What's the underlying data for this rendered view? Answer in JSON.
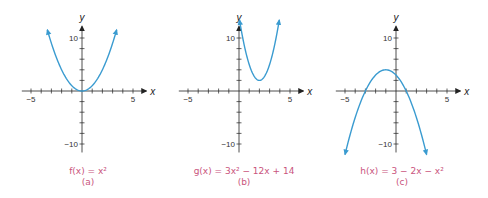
{
  "figure": {
    "panels": [
      {
        "id": "a",
        "formula_text": "f(x) = x²",
        "letter": "(a)",
        "origin": [
          82,
          91
        ]
      },
      {
        "id": "b",
        "formula_text": "g(x) = 3x² − 12x + 14",
        "letter": "(b)",
        "origin": [
          239,
          91
        ]
      },
      {
        "id": "c",
        "formula_text": "h(x) = 3 − 2x − x²",
        "letter": "(c)",
        "origin": [
          396,
          91
        ]
      }
    ],
    "axis_labels": {
      "x": "x",
      "y": "y"
    },
    "tick_labels": {
      "x_neg": "−5",
      "x_pos": "5",
      "y_pos": "10",
      "y_neg": "−10"
    },
    "colors": {
      "curve": "#3a9bd0",
      "axis": "#222222",
      "caption": "#c9547d"
    }
  },
  "chart_data": [
    {
      "type": "line",
      "title": "f(x) = x²",
      "subtitle": "(a)",
      "xlabel": "x",
      "ylabel": "y",
      "xlim": [
        -5,
        5
      ],
      "ylim": [
        -10,
        10
      ],
      "x_ticks_step": 1,
      "y_ticks_step": 2,
      "tick_labels_x": [
        "−5",
        "5"
      ],
      "tick_labels_y": [
        "10",
        "−10"
      ],
      "grid": false,
      "function": "x^2",
      "coeffs": {
        "a": 1,
        "b": 0,
        "c": 0
      },
      "domain_drawn": [
        -3.4,
        3.4
      ],
      "arrows": "both-ends",
      "vertex": [
        0,
        0
      ]
    },
    {
      "type": "line",
      "title": "g(x) = 3x² − 12x + 14",
      "subtitle": "(b)",
      "xlabel": "x",
      "ylabel": "y",
      "xlim": [
        -5,
        5
      ],
      "ylim": [
        -10,
        10
      ],
      "x_ticks_step": 1,
      "y_ticks_step": 2,
      "tick_labels_x": [
        "−5",
        "5"
      ],
      "tick_labels_y": [
        "10",
        "−10"
      ],
      "grid": false,
      "function": "3x^2 - 12x + 14",
      "coeffs": {
        "a": 3,
        "b": -12,
        "c": 14
      },
      "domain_drawn": [
        0.05,
        3.95
      ],
      "arrows": "both-ends",
      "vertex": [
        2,
        2
      ]
    },
    {
      "type": "line",
      "title": "h(x) = 3 − 2x − x²",
      "subtitle": "(c)",
      "xlabel": "x",
      "ylabel": "y",
      "xlim": [
        -5,
        5
      ],
      "ylim": [
        -10,
        10
      ],
      "x_ticks_step": 1,
      "y_ticks_step": 2,
      "tick_labels_x": [
        "−5",
        "5"
      ],
      "tick_labels_y": [
        "10",
        "−10"
      ],
      "grid": false,
      "function": "3 - 2x - x^2",
      "coeffs": {
        "a": -1,
        "b": -2,
        "c": 3
      },
      "domain_drawn": [
        -5.0,
        3.0
      ],
      "arrows": "both-ends",
      "vertex": [
        -1,
        4
      ],
      "x_intercepts": [
        -3,
        1
      ]
    }
  ]
}
